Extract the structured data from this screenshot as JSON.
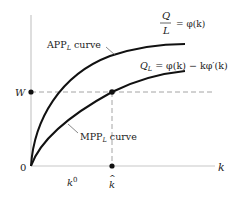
{
  "diagram": {
    "type": "economics-production-curves",
    "axes": {
      "origin_label": "0",
      "x_label": "k",
      "y_tick_label": "W"
    },
    "x_ticks": {
      "k0": {
        "base": "k",
        "sup": "0"
      },
      "khat": {
        "base": "k",
        "accent": "^"
      }
    },
    "curves": {
      "app": {
        "label_main": "APP",
        "label_sub": "L",
        "label_suffix": " curve",
        "eq_num": "Q",
        "eq_den": "L",
        "eq_rhs": "= φ(k)"
      },
      "mpp": {
        "label_main": "MPP",
        "label_sub": "L",
        "label_suffix": "curve",
        "eq_lhs_main": "Q",
        "eq_lhs_sub": "L",
        "eq_rhs": " = φ(k) − kφ′(k)"
      }
    },
    "colors": {
      "curve": "#111111",
      "axis": "#c8c8c8",
      "dashed": "#9a9a9a",
      "dot": "#111111",
      "text": "#222222"
    }
  }
}
